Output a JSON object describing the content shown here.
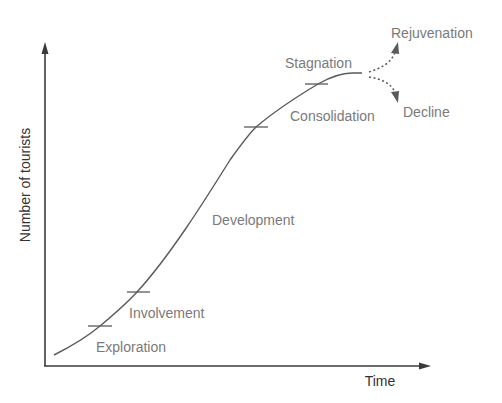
{
  "diagram": {
    "axes": {
      "y_label": "Number of tourists",
      "x_label": "Time"
    },
    "stages": [
      {
        "id": "exploration",
        "label": "Exploration"
      },
      {
        "id": "involvement",
        "label": "Involvement"
      },
      {
        "id": "development",
        "label": "Development"
      },
      {
        "id": "consolidation",
        "label": "Consolidation"
      },
      {
        "id": "stagnation",
        "label": "Stagnation"
      }
    ],
    "outcomes": [
      {
        "id": "rejuvenation",
        "label": "Rejuvenation"
      },
      {
        "id": "decline",
        "label": "Decline"
      }
    ],
    "colors": {
      "axis": "#3a3a3a",
      "curve": "#5a5a5a",
      "stage_text": "#7a7a7a",
      "axis_text": "#333333",
      "background": "#ffffff"
    }
  }
}
